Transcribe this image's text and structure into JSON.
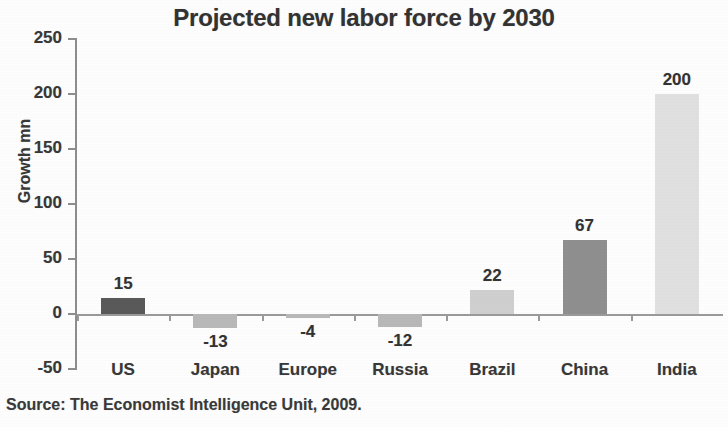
{
  "chart_data": {
    "type": "bar",
    "title": "Projected new labor force by 2030",
    "xlabel": "",
    "ylabel": "Growth mn",
    "categories": [
      "US",
      "Japan",
      "Europe",
      "Russia",
      "Brazil",
      "China",
      "India"
    ],
    "values": [
      15,
      -13,
      -4,
      -12,
      22,
      67,
      200
    ],
    "value_labels": [
      "15",
      "-13",
      "-4",
      "-12",
      "22",
      "67",
      "200"
    ],
    "bar_colors": [
      "#595959",
      "#b8b8b8",
      "#b8b8b8",
      "#b8b8b8",
      "#cfcfcf",
      "#8f8f8f",
      "#e0e0e0"
    ],
    "ylim": [
      -50,
      250
    ],
    "yticks": [
      250,
      200,
      150,
      100,
      50,
      0,
      -50
    ],
    "ytick_labels": [
      "250",
      "200",
      "150",
      "100",
      "50",
      "0",
      "-50"
    ],
    "grid": false,
    "legend": "none",
    "source": "Source: The Economist Intelligence Unit, 2009."
  },
  "colors": {
    "background": "#fdfdfd",
    "axis": "#8d8d8d",
    "text": "#333333"
  }
}
